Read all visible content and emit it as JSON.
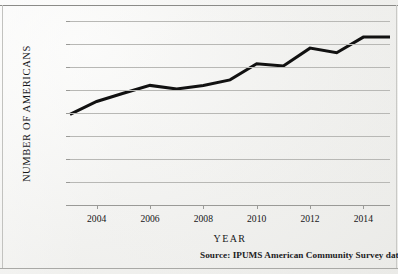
{
  "figure": {
    "source_note": "Source:  IPUMS American Community Survey data"
  },
  "chart_data": {
    "type": "line",
    "title": "",
    "subtitle": "",
    "xlabel": "YEAR",
    "ylabel": "NUMBER OF AMERICANS",
    "x": [
      2003,
      2004,
      2005,
      2006,
      2007,
      2008,
      2009,
      2010,
      2011,
      2012,
      2013,
      2014,
      2015
    ],
    "values": [
      197000,
      225000,
      243000,
      260000,
      252000,
      260000,
      272000,
      307000,
      302000,
      341000,
      331000,
      365000,
      365000
    ],
    "series": [
      {
        "name": "Number of Americans",
        "values": [
          197000,
          225000,
          243000,
          260000,
          252000,
          260000,
          272000,
          307000,
          302000,
          341000,
          331000,
          365000,
          365000
        ]
      }
    ],
    "xlim": [
      2003,
      2015
    ],
    "ylim": [
      0,
      400000
    ],
    "ytick_values": [
      0,
      50000,
      100000,
      150000,
      200000,
      250000,
      300000,
      350000,
      400000
    ],
    "ytick_labels": [
      "0",
      "50,000",
      "100,000",
      "150,000",
      "200,000",
      "250,000",
      "300,000",
      "350,000",
      "400,000"
    ],
    "xtick_values": [
      2004,
      2006,
      2008,
      2010,
      2012,
      2014
    ],
    "xtick_labels": [
      "2004",
      "2006",
      "2008",
      "2010",
      "2012",
      "2014"
    ],
    "grid": "horizontal",
    "legend": "none",
    "line_color": "#111111",
    "line_width": 3,
    "markers": "none",
    "background_color": "#f2f2f0"
  }
}
